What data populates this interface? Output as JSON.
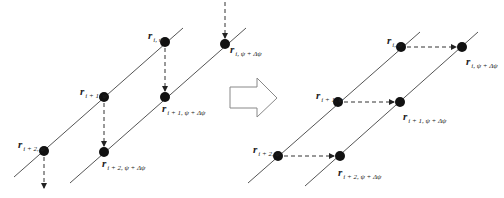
{
  "colors": {
    "line": "#555555",
    "dot": "#111111",
    "arrow": "#333333",
    "block_arrow": "#888888"
  },
  "left_panel": {
    "lines": [
      {
        "x1": 14,
        "y1": 177,
        "x2": 183,
        "y2": 28
      },
      {
        "x1": 70,
        "y1": 183,
        "x2": 246,
        "y2": 28
      }
    ],
    "dots": [
      {
        "cx": 44,
        "cy": 151
      },
      {
        "cx": 104,
        "cy": 97
      },
      {
        "cx": 165,
        "cy": 42
      },
      {
        "cx": 104,
        "cy": 152
      },
      {
        "cx": 165,
        "cy": 97
      },
      {
        "cx": 225,
        "cy": 44
      }
    ],
    "arrows": [
      {
        "x1": 225,
        "y1": 2,
        "x2": 225,
        "y2": 38
      },
      {
        "x1": 165,
        "y1": 48,
        "x2": 165,
        "y2": 91
      },
      {
        "x1": 104,
        "y1": 103,
        "x2": 104,
        "y2": 146
      },
      {
        "x1": 44,
        "y1": 157,
        "x2": 44,
        "y2": 188
      }
    ],
    "labels": [
      {
        "x": 148,
        "y": 26,
        "r": "r",
        "sub": "i, ψ"
      },
      {
        "x": 230,
        "y": 40,
        "r": "r",
        "sub": "i, ψ + Δψ"
      },
      {
        "x": 80,
        "y": 82,
        "r": "r",
        "sub": "i + 1, ψ"
      },
      {
        "x": 162,
        "y": 99,
        "r": "r",
        "sub": "i + 1, ψ + Δψ"
      },
      {
        "x": 18,
        "y": 135,
        "r": "r",
        "sub": "i + 2, ψ"
      },
      {
        "x": 102,
        "y": 154,
        "r": "r",
        "sub": "i + 2, ψ + Δψ"
      }
    ]
  },
  "block_arrow": {
    "points": "230,87 257,87 257,78 277,98 257,117 257,108 230,108"
  },
  "right_panel": {
    "lines": [
      {
        "x1": 248,
        "y1": 183,
        "x2": 420,
        "y2": 32
      },
      {
        "x1": 305,
        "y1": 186,
        "x2": 478,
        "y2": 32
      }
    ],
    "dots": [
      {
        "cx": 278,
        "cy": 156
      },
      {
        "cx": 338,
        "cy": 102
      },
      {
        "cx": 401,
        "cy": 47
      },
      {
        "cx": 340,
        "cy": 156
      },
      {
        "cx": 400,
        "cy": 102
      },
      {
        "cx": 462,
        "cy": 47
      }
    ],
    "arrows": [
      {
        "x1": 407,
        "y1": 47,
        "x2": 456,
        "y2": 47
      },
      {
        "x1": 344,
        "y1": 102,
        "x2": 394,
        "y2": 102
      },
      {
        "x1": 284,
        "y1": 156,
        "x2": 334,
        "y2": 156
      }
    ],
    "labels": [
      {
        "x": 387,
        "y": 31,
        "r": "r",
        "sub": "i, ψ"
      },
      {
        "x": 466,
        "y": 52,
        "r": "r",
        "sub": "i, ψ + Δψ"
      },
      {
        "x": 316,
        "y": 86,
        "r": "r",
        "sub": "i + 1, ψ"
      },
      {
        "x": 403,
        "y": 107,
        "r": "r",
        "sub": "i + 1, ψ + Δψ"
      },
      {
        "x": 253,
        "y": 140,
        "r": "r",
        "sub": "i + 2, ψ"
      },
      {
        "x": 338,
        "y": 163,
        "r": "r",
        "sub": "i + 2, ψ + Δψ"
      }
    ]
  }
}
